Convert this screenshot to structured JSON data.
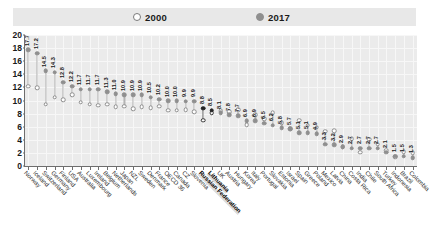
{
  "legend": {
    "items": [
      {
        "label": "2000",
        "marker": "hollow-circle-icon",
        "color": "#ffffff"
      },
      {
        "label": "2017",
        "marker": "filled-circle-icon",
        "color": "#8f8f8f"
      }
    ]
  },
  "axis": {
    "y_ticks": [
      "20",
      "18",
      "16",
      "14",
      "12",
      "10",
      "8",
      "6",
      "4",
      "2",
      "0"
    ]
  },
  "chart_data": {
    "type": "scatter",
    "subtype": "dumbbell",
    "title": "",
    "xlabel": "",
    "ylabel": "",
    "ylim": [
      0,
      20
    ],
    "grid": true,
    "legend_position": "top",
    "categories": [
      "Norway",
      "Iceland",
      "Switzerland",
      "Germany",
      "Finland",
      "USA",
      "Australia",
      "Luxembourg",
      "Ireland",
      "Belgium",
      "Netherlands",
      "Japan",
      "NZL",
      "Sweden",
      "Denmark",
      "France",
      "OECD 36",
      "Canada",
      "CZ",
      "Slovenia",
      "Russian Federation",
      "Lithuania",
      "UK",
      "Austria",
      "Hungary",
      "Korea",
      "Italy",
      "Portugal",
      "Slovakia",
      "Estonia",
      "Israel",
      "Spain",
      "Greece",
      "Poland",
      "Mexico",
      "Latvia",
      "China",
      "Costa Rica",
      "India",
      "Chile",
      "South Africa",
      "Turkey",
      "Indonesia",
      "Brazil",
      "Colombia"
    ],
    "highlighted": [
      "Russian Federation",
      "Lithuania"
    ],
    "series": [
      {
        "name": "2000",
        "marker": "hollow-circle-icon",
        "values": [
          12.2,
          11.9,
          9.4,
          10.5,
          10.1,
          10.9,
          9.7,
          9.4,
          9.3,
          9.4,
          9.0,
          9.1,
          8.7,
          9.0,
          8.9,
          9.1,
          8.5,
          8.5,
          8.6,
          8.3,
          7.0,
          8.1,
          8.4,
          8.3,
          8.6,
          6.3,
          7.8,
          7.2,
          8.1,
          6.6,
          5.7,
          7.0,
          6.2,
          5.9,
          5.3,
          5.4,
          2.9,
          4.2,
          2.1,
          4.1,
          3.3,
          2.4,
          1.4,
          2.2,
          2.0
        ]
      },
      {
        "name": "2017",
        "marker": "filled-circle-icon",
        "values": [
          17.7,
          17.2,
          14.5,
          14.3,
          12.8,
          12.2,
          11.7,
          11.7,
          11.7,
          11.3,
          11.0,
          10.9,
          10.9,
          10.9,
          10.5,
          10.2,
          10.0,
          10.0,
          9.9,
          9.9,
          8.8,
          8.5,
          8.1,
          7.8,
          7.7,
          6.9,
          6.9,
          6.5,
          6.2,
          5.8,
          5.7,
          5.1,
          5.1,
          4.9,
          3.3,
          3.2,
          2.9,
          2.7,
          2.7,
          2.7,
          2.7,
          2.1,
          1.5,
          1.5,
          1.3
        ]
      }
    ],
    "value_labels_2017": [
      "17.7",
      "17.2",
      "14.5",
      "14.3",
      "12.8",
      "12.2",
      "11.7",
      "11.7",
      "11.7",
      "11.3",
      "11.0",
      "10.9",
      "10.9",
      "10.9",
      "10.5",
      "10.2",
      "10.0",
      "10.0",
      "9.9",
      "9.9",
      "8.8",
      "8.5",
      "8.1",
      "7.8",
      "7.7",
      "6.9",
      "6.9",
      "6.5",
      "6.2",
      "5.8",
      "5.7",
      "5.1",
      "5.1",
      "4.9",
      "3.3",
      "3.2",
      "2.9",
      "2.7",
      "2.7",
      "2.7",
      "2.7",
      "2.1",
      "1.5",
      "1.5",
      "1.3"
    ]
  }
}
